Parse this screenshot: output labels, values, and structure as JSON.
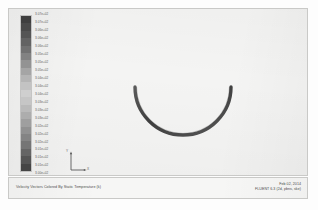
{
  "plot": {
    "footer_title": "Velocity Vectors Colored By Static Temperature (k)",
    "date": "Feb 02, 2014",
    "solver": "FLUENT 6.3 (2d, pbns, ske)",
    "axis_x_label": "X",
    "axis_y_label": "Y",
    "background_color": "#f4f4f3",
    "frame_color": "#c9c9c7",
    "geometry_color": "#4f4f4f"
  },
  "chart_data": {
    "type": "scatter",
    "title": "Velocity Vectors Colored By Static Temperature (k)",
    "xlabel": "X",
    "ylabel": "Y",
    "grid": false,
    "legend_position": "left",
    "colorbar": {
      "variable": "Static Temperature",
      "units": "k",
      "n_levels": 21,
      "max": "3.07e+02",
      "min": "3.00e+02",
      "tick_labels": [
        "3.07e+02",
        "3.07e+02",
        "3.06e+02",
        "3.06e+02",
        "3.06e+02",
        "3.05e+02",
        "3.05e+02",
        "3.05e+02",
        "3.04e+02",
        "3.04e+02",
        "3.04e+02",
        "3.03e+02",
        "3.03e+02",
        "3.03e+02",
        "3.02e+02",
        "3.02e+02",
        "3.02e+02",
        "3.01e+02",
        "3.01e+02",
        "3.01e+02",
        "3.00e+02"
      ],
      "swatch_colors": [
        "#3f3f3f",
        "#4a4a4a",
        "#555555",
        "#636363",
        "#717171",
        "#828282",
        "#939393",
        "#a5a5a5",
        "#b5b5b5",
        "#c3c3c3",
        "#cfcfcf",
        "#c6c6c6",
        "#bababa",
        "#adadad",
        "#9f9f9f",
        "#919191",
        "#848484",
        "#757575",
        "#656565",
        "#555555",
        "#454545"
      ]
    },
    "geometry": {
      "shape": "u-bend-duct-wall",
      "description": "Semicircular U-shaped duct wall outline",
      "cx": 182,
      "cy": 114,
      "radius": 48,
      "wall_thickness": 3,
      "arc_start_deg": 0,
      "arc_end_deg": 180
    }
  }
}
